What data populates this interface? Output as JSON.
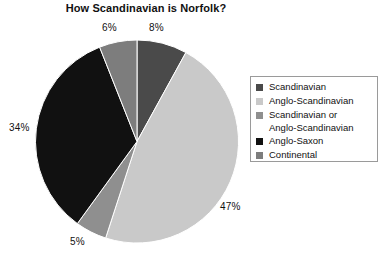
{
  "chart_data": {
    "type": "pie",
    "title": "How Scandinavian is Norfolk?",
    "xlabel": "",
    "ylabel": "",
    "legend_position": "right",
    "grid": false,
    "start_angle_deg": 0,
    "direction": "clockwise",
    "categories": [
      "Scandinavian",
      "Anglo-Scandinavian",
      "Scandinavian or Anglo-Scandinavian",
      "Anglo-Saxon",
      "Continental"
    ],
    "values": [
      8,
      47,
      5,
      34,
      6
    ],
    "value_labels": [
      "8%",
      "47%",
      "5%",
      "34%",
      "6%"
    ],
    "colors": [
      "#4a4a4a",
      "#c9c9c9",
      "#8f8f8f",
      "#111111",
      "#7d7d7d"
    ],
    "slices": [
      {
        "label": "Scandinavian",
        "value": 8,
        "value_label": "8%",
        "color": "#4a4a4a"
      },
      {
        "label": "Anglo-Scandinavian",
        "value": 47,
        "value_label": "47%",
        "color": "#c9c9c9"
      },
      {
        "label": "Scandinavian or Anglo-Scandinavian",
        "value": 5,
        "value_label": "5%",
        "color": "#8f8f8f"
      },
      {
        "label": "Anglo-Saxon",
        "value": 34,
        "value_label": "34%",
        "color": "#111111"
      },
      {
        "label": "Continental",
        "value": 6,
        "value_label": "6%",
        "color": "#7d7d7d"
      }
    ]
  },
  "legend": {
    "items": [
      {
        "label": "Scandinavian",
        "color": "#4a4a4a"
      },
      {
        "label": "Anglo-Scandinavian",
        "color": "#c9c9c9"
      },
      {
        "label": "Scandinavian or\nAnglo-Scandinavian",
        "color": "#8f8f8f"
      },
      {
        "label": "Anglo-Saxon",
        "color": "#111111"
      },
      {
        "label": "Continental",
        "color": "#7d7d7d"
      }
    ]
  },
  "labels": {
    "six": "6%",
    "eight": "8%",
    "thirtyfour": "34%",
    "fortyseven": "47%",
    "five": "5%"
  }
}
